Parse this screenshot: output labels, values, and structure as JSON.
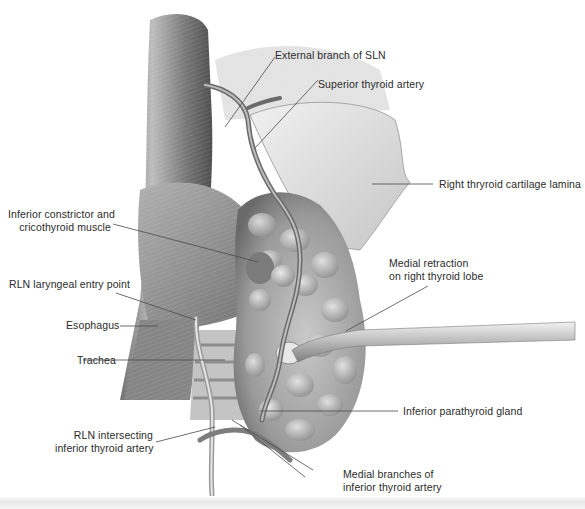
{
  "figure": {
    "colors": {
      "ink": "#2b2b2b",
      "leader": "#4a4a4a",
      "tissue_dark": "#5a5a5a",
      "tissue_mid": "#9a9a9a",
      "tissue_light": "#d8d8d8",
      "background": "#ffffff"
    }
  },
  "labels": [
    {
      "id": "external-branch-sln",
      "lines": [
        "External branch of SLN"
      ]
    },
    {
      "id": "superior-thyroid-artery",
      "lines": [
        "Superior thyroid artery"
      ]
    },
    {
      "id": "right-thyroid-cartilage-lamina",
      "lines": [
        "Right thryroid cartilage lamina"
      ]
    },
    {
      "id": "inferior-constrictor",
      "lines": [
        "Inferior constrictor and",
        "cricothyroid muscle"
      ]
    },
    {
      "id": "rln-entry-point",
      "lines": [
        "RLN laryngeal entry point"
      ]
    },
    {
      "id": "esophagus",
      "lines": [
        "Esophagus"
      ]
    },
    {
      "id": "trachea",
      "lines": [
        "Trachea"
      ]
    },
    {
      "id": "medial-retraction",
      "lines": [
        "Medial retraction",
        "on right thyroid lobe"
      ]
    },
    {
      "id": "inferior-parathyroid",
      "lines": [
        "Inferior parathyroid gland"
      ]
    },
    {
      "id": "rln-intersecting",
      "lines": [
        "RLN intersecting",
        "inferior thyroid artery"
      ]
    },
    {
      "id": "medial-branches",
      "lines": [
        "Medial branches of",
        "inferior thyroid artery"
      ]
    }
  ]
}
